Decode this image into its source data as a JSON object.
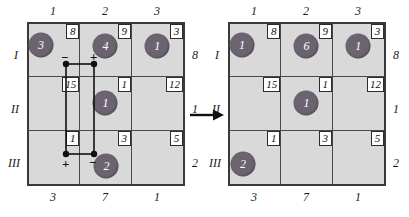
{
  "figure": {
    "type": "transportation-tableau-pair",
    "arrow_icon": "right-arrow-icon"
  },
  "left_tableau": {
    "name": "current-solution-with-stepping-stone-loop",
    "column_headers": [
      "1",
      "2",
      "3"
    ],
    "row_headers": [
      "I",
      "II",
      "III"
    ],
    "supply": [
      "8",
      "1",
      "2"
    ],
    "demand": [
      "3",
      "7",
      "1"
    ],
    "costs": [
      [
        "8",
        "9",
        "3"
      ],
      [
        "15",
        "1",
        "12"
      ],
      [
        "1",
        "3",
        "5"
      ]
    ],
    "allocations": [
      [
        "3",
        "4",
        "1"
      ],
      [
        "",
        "1",
        ""
      ],
      [
        "",
        "2",
        ""
      ]
    ],
    "loop": {
      "signs": [
        {
          "cell": "I-1",
          "sign": "−"
        },
        {
          "cell": "I-2",
          "sign": "+"
        },
        {
          "cell": "III-1",
          "sign": "+"
        },
        {
          "cell": "III-2",
          "sign": "−"
        }
      ]
    }
  },
  "right_tableau": {
    "name": "improved-solution",
    "column_headers": [
      "1",
      "2",
      "3"
    ],
    "row_headers": [
      "I",
      "II",
      "III"
    ],
    "supply": [
      "8",
      "1",
      "2"
    ],
    "demand": [
      "3",
      "7",
      "1"
    ],
    "costs": [
      [
        "8",
        "9",
        "3"
      ],
      [
        "15",
        "1",
        "12"
      ],
      [
        "1",
        "3",
        "5"
      ]
    ],
    "allocations": [
      [
        "1",
        "6",
        "1"
      ],
      [
        "",
        "1",
        ""
      ],
      [
        "2",
        "",
        ""
      ]
    ]
  }
}
